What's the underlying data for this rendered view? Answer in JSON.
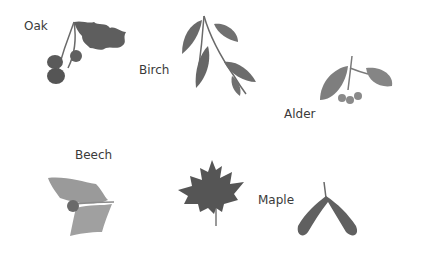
{
  "labels": {
    "oak": "Oak",
    "birch": "Birch",
    "alder": "Alder",
    "beech": "Beech",
    "maple": "Maple"
  },
  "illustrations": [
    {
      "name": "oak",
      "icon": "oak-leaves-acorns-icon"
    },
    {
      "name": "birch",
      "icon": "birch-leaves-icon"
    },
    {
      "name": "alder",
      "icon": "alder-leaves-catkins-icon"
    },
    {
      "name": "beech",
      "icon": "beech-leaves-nut-icon"
    },
    {
      "name": "maple",
      "icon": "maple-leaf-icon"
    },
    {
      "name": "maple-seed",
      "icon": "maple-samara-icon"
    }
  ],
  "colors": {
    "background": "#ffffff",
    "leaf_dark": "#5e5e5e",
    "leaf_mid": "#7a7a7a",
    "leaf_light": "#9a9a9a",
    "text": "#3a3a3a"
  }
}
